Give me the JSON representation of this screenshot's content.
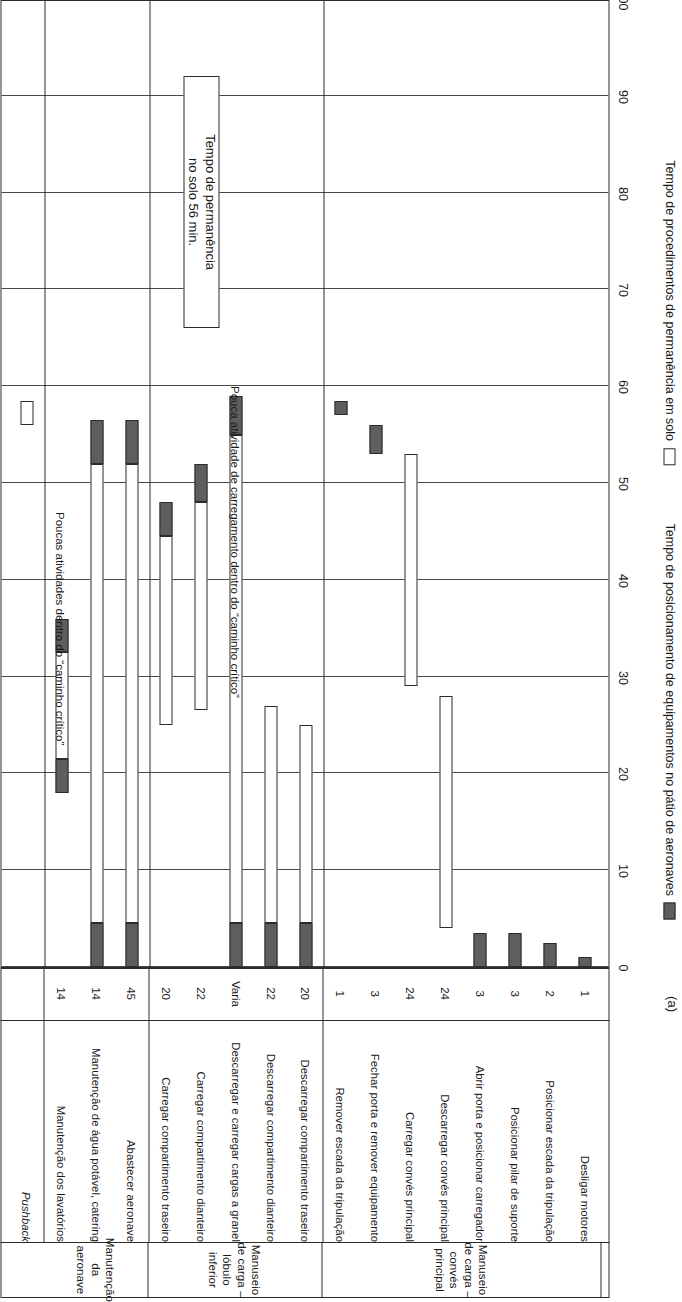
{
  "figure": {
    "label": "(a)",
    "callout": "Tempo de permanência\nno solo 56 min.",
    "notes": [
      "Pouca atividade de carregamento dentro do “caminho crítico”",
      "Poucas atividades dentro do “caminho crítico”"
    ]
  },
  "axis": {
    "ticks": [
      "0",
      "10",
      "20",
      "30",
      "40",
      "50",
      "60",
      "70",
      "80",
      "90",
      "100"
    ],
    "min": 0,
    "max": 100
  },
  "legend": {
    "items": [
      {
        "swatch": "filled",
        "label": "Tempo de posicionamento de equipamentos no pátio de aeronaves",
        "color": "#5e5e5e"
      },
      {
        "swatch": "open",
        "label": "Tempo de procedimentos de permanência em solo",
        "color": "#ffffff"
      }
    ]
  },
  "groups": [
    {
      "name": "Manuseio de carga –\nconvés principal",
      "rows": 8
    },
    {
      "name": "Manuseio de carga –\nlóbulo inferior",
      "rows": 5
    },
    {
      "name": "Manutenção\nda aeronave",
      "rows": 3
    },
    {
      "name": "",
      "rows": 1
    }
  ],
  "columns": {
    "task": "",
    "duration": ""
  },
  "chart_data": {
    "type": "bar",
    "title": "",
    "xlabel": "",
    "ylabel": "",
    "xlim": [
      0,
      100
    ],
    "orientation": "horizontal",
    "grid": true,
    "legend_position": "bottom",
    "categories": [
      "Desligar motores",
      "Posicionar escada da tripulação",
      "Posicionar pilar de suporte",
      "Abrir porta e posicionar carregador",
      "Descarregar convés principal",
      "Carregar convés principal",
      "Fechar porta e remover equipamento",
      "Remover escada da tripulação",
      "Descarregar compartimento traseiro",
      "Descarregar compartimento dianteiro",
      "Descarregar e carregar cargas a granel",
      "Carregar compartimento dianteiro",
      "Carregar compartimento traseiro",
      "Abastecer aeronave",
      "Manutenção de água potável, catering",
      "Manutenção dos lavatórios",
      "Pushback"
    ],
    "durations": [
      "1",
      "2",
      "3",
      "3",
      "24",
      "24",
      "3",
      "1",
      "20",
      "22",
      "Varia",
      "22",
      "20",
      "45",
      "14",
      "14",
      ""
    ],
    "rows": [
      {
        "task": "Desligar motores",
        "duration": "1",
        "italic": false,
        "group": 0,
        "segments": [
          {
            "type": "fill",
            "start": 0,
            "end": 1
          }
        ]
      },
      {
        "task": "Posicionar escada da tripulação",
        "duration": "2",
        "italic": false,
        "group": 0,
        "segments": [
          {
            "type": "fill",
            "start": 0,
            "end": 2.5
          }
        ]
      },
      {
        "task": "Posicionar pilar de suporte",
        "duration": "3",
        "italic": false,
        "group": 0,
        "segments": [
          {
            "type": "fill",
            "start": 0,
            "end": 3.5
          }
        ]
      },
      {
        "task": "Abrir porta e posicionar carregador",
        "duration": "3",
        "italic": false,
        "group": 0,
        "segments": [
          {
            "type": "fill",
            "start": 0,
            "end": 3.5
          }
        ]
      },
      {
        "task": "Descarregar convés principal",
        "duration": "24",
        "italic": false,
        "group": 0,
        "segments": [
          {
            "type": "open",
            "start": 4,
            "end": 28
          }
        ]
      },
      {
        "task": "Carregar convés principal",
        "duration": "24",
        "italic": false,
        "group": 0,
        "segments": [
          {
            "type": "open",
            "start": 29,
            "end": 53
          }
        ]
      },
      {
        "task": "Fechar porta e remover equipamento",
        "duration": "3",
        "italic": false,
        "group": 0,
        "segments": [
          {
            "type": "fill",
            "start": 53,
            "end": 56
          }
        ]
      },
      {
        "task": "Remover escada da tripulação",
        "duration": "1",
        "italic": false,
        "group": 0,
        "segments": [
          {
            "type": "fill",
            "start": 57,
            "end": 58.5
          }
        ]
      },
      {
        "task": "Descarregar compartimento traseiro",
        "duration": "20",
        "italic": false,
        "group": 1,
        "segments": [
          {
            "type": "fill",
            "start": 0,
            "end": 4.5
          },
          {
            "type": "open",
            "start": 4.5,
            "end": 25
          }
        ]
      },
      {
        "task": "Descarregar compartimento dianteiro",
        "duration": "22",
        "italic": false,
        "group": 1,
        "segments": [
          {
            "type": "fill",
            "start": 0,
            "end": 4.5
          },
          {
            "type": "open",
            "start": 4.5,
            "end": 27
          }
        ]
      },
      {
        "task": "Descarregar e carregar cargas a granel",
        "duration": "Varia",
        "italic": false,
        "group": 1,
        "segments": [
          {
            "type": "fill",
            "start": 0,
            "end": 4.5
          },
          {
            "type": "open",
            "start": 4.5,
            "end": 55
          },
          {
            "type": "fill",
            "start": 55,
            "end": 59
          }
        ]
      },
      {
        "task": "Carregar compartimento dianteiro",
        "duration": "22",
        "italic": false,
        "group": 1,
        "segments": [
          {
            "type": "open",
            "start": 26.5,
            "end": 48
          },
          {
            "type": "fill",
            "start": 48,
            "end": 52
          }
        ]
      },
      {
        "task": "Carregar compartimento traseiro",
        "duration": "20",
        "italic": false,
        "group": 1,
        "segments": [
          {
            "type": "open",
            "start": 25,
            "end": 44.5
          },
          {
            "type": "fill",
            "start": 44.5,
            "end": 48
          }
        ]
      },
      {
        "task": "Abastecer aeronave",
        "duration": "45",
        "italic": false,
        "group": 2,
        "segments": [
          {
            "type": "fill",
            "start": 0,
            "end": 4.5
          },
          {
            "type": "open",
            "start": 4.5,
            "end": 52
          },
          {
            "type": "fill",
            "start": 52,
            "end": 56.5
          }
        ]
      },
      {
        "task": "Manutenção de água potável, catering",
        "duration": "14",
        "italic": false,
        "group": 2,
        "segments": [
          {
            "type": "fill",
            "start": 0,
            "end": 4.5
          },
          {
            "type": "open",
            "start": 4.5,
            "end": 52
          },
          {
            "type": "fill",
            "start": 52,
            "end": 56.5
          }
        ]
      },
      {
        "task": "Manutenção dos lavatórios",
        "duration": "14",
        "italic": false,
        "group": 2,
        "segments": [
          {
            "type": "fill",
            "start": 18,
            "end": 21.5
          },
          {
            "type": "open",
            "start": 21.5,
            "end": 32.5
          },
          {
            "type": "fill",
            "start": 32.5,
            "end": 36
          }
        ]
      },
      {
        "task": "Pushback",
        "duration": "",
        "italic": true,
        "group": 3,
        "segments": [
          {
            "type": "open",
            "start": 56,
            "end": 58.5
          }
        ]
      }
    ]
  }
}
